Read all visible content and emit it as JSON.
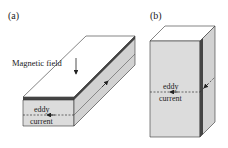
{
  "panels": [
    {
      "id": "a",
      "label": "(a)",
      "annotation": "Magnetic field",
      "eddy_label_line1": "eddy",
      "eddy_label_line2": "current",
      "description": "Thin horizontal slab with magnetic field perpendicular to large face"
    },
    {
      "id": "b",
      "label": "(b)",
      "eddy_label_line1": "eddy",
      "eddy_label_line2": "current",
      "description": "Vertical block with eddy current path across face"
    }
  ],
  "colors": {
    "top_face": "#ffffff",
    "front_face": "#dcdcdc",
    "side_face": "#d0d0d0",
    "edge": "#333333",
    "dark_band": "#444444",
    "dashed": "#333333"
  }
}
